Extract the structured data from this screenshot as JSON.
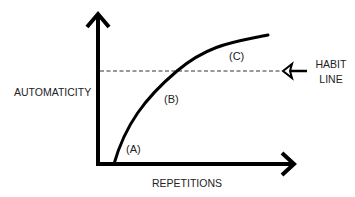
{
  "axes": {
    "y_label": "AUTOMATICITY",
    "x_label": "REPETITIONS"
  },
  "curve_labels": {
    "a": "(A)",
    "b": "(B)",
    "c": "(C)"
  },
  "habit_line": {
    "label_line1": "HABIT",
    "label_line2": "LINE",
    "style": "dashed"
  },
  "colors": {
    "ink": "#000000",
    "text": "#222222",
    "background": "#ffffff"
  }
}
